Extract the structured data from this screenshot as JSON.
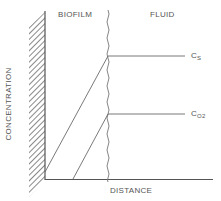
{
  "diagram": {
    "regions": {
      "left_label": "BIOFILM",
      "right_label": "FLUID"
    },
    "axes": {
      "x_label": "DISTANCE",
      "y_label": "CONCENTRATION"
    },
    "curves": [
      {
        "name": "substrate",
        "label_main": "C",
        "label_sub": "S"
      },
      {
        "name": "oxygen",
        "label_main": "C",
        "label_sub": "O2"
      }
    ],
    "colors": {
      "line": "#6a6a6a",
      "text": "#555555"
    }
  }
}
